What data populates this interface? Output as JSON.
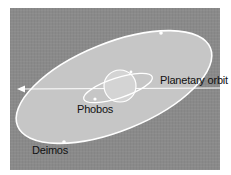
{
  "diagram": {
    "labels": {
      "planetary_orbit": "Planetary orbit",
      "phobos": "Phobos",
      "deimos": "Deimos"
    },
    "colors": {
      "background": "#8a8a8a",
      "orbit_plane": "#c6c6c6",
      "orbit_line": "#ffffff",
      "text": "#111111"
    }
  }
}
